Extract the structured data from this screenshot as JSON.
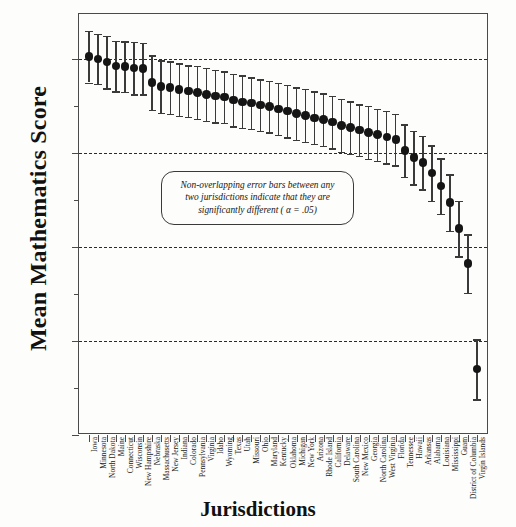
{
  "chart_data": {
    "type": "scatter",
    "title": "",
    "xlabel": "Jurisdictions",
    "ylabel": "Mean Mathematics Score",
    "ylim": [
      210,
      296
    ],
    "ytick_labels": [
      "210",
      "230",
      "250",
      "270",
      "290"
    ],
    "yticks": [
      210,
      230,
      250,
      270,
      290
    ],
    "yticks_minor": [
      220,
      240,
      260,
      280
    ],
    "grid": "horizontal-dashed",
    "legend": "none",
    "annotation": {
      "line1": "Non-overlapping error bars between any",
      "line2": "two jurisdictions indicate that they are",
      "line3": "significantly different ( α = .05)"
    },
    "categories": [
      "Iowa",
      "Minnesota",
      "North  Dakota",
      "Maine",
      "Connecticut",
      "Wisconsin",
      "New Hampshire",
      "Nebraska",
      "Massachusetts",
      "New Jersey",
      "Indiana",
      "Colorado",
      "Pennsylvania",
      "Virginia",
      "Idaho",
      "Wyoming",
      "Texas",
      "Utah",
      "Missouri",
      "Ohio",
      "Maryland",
      "Kentucky",
      "Oklahoma",
      "Michigan",
      "New  York",
      "Arizona",
      "Rhode  Island",
      "California",
      "Delaware",
      "South  Carolina",
      "New  Mexico",
      "Georgia",
      "North Carolina",
      "West  Virginia",
      "Florida",
      "Tennessee",
      "Hawaii",
      "Arkansas",
      "Alabama",
      "Louisiana",
      "Mississippi",
      "Guam",
      "District of Columbia",
      "Virgin  Islands"
    ],
    "values": [
      290.5,
      290.0,
      289.4,
      288.5,
      288.4,
      288.1,
      288.0,
      285.0,
      284.1,
      283.9,
      283.5,
      283.2,
      282.9,
      282.5,
      282.1,
      281.9,
      281.3,
      280.9,
      280.6,
      280.2,
      279.9,
      279.4,
      278.9,
      278.4,
      278.0,
      277.5,
      277.1,
      276.6,
      275.9,
      275.4,
      274.9,
      274.4,
      273.9,
      273.4,
      272.9,
      270.5,
      269.0,
      268.0,
      265.7,
      263.0,
      259.5,
      253.9,
      246.5,
      224.0
    ],
    "errors": [
      5.5,
      5.3,
      5.6,
      5.4,
      5.4,
      5.6,
      5.5,
      5.8,
      5.6,
      5.6,
      5.6,
      5.5,
      5.6,
      5.6,
      5.6,
      5.5,
      5.6,
      5.6,
      5.5,
      5.5,
      5.5,
      5.5,
      5.6,
      5.6,
      5.6,
      5.6,
      5.6,
      5.6,
      5.6,
      5.6,
      5.5,
      5.6,
      5.5,
      5.6,
      5.5,
      5.6,
      5.7,
      5.7,
      5.9,
      5.9,
      6.0,
      5.9,
      6.2,
      6.4
    ]
  }
}
